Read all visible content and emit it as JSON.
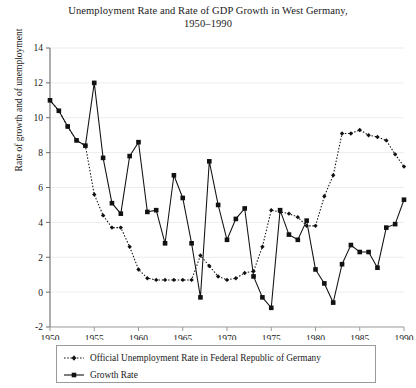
{
  "chart_data": {
    "type": "line",
    "title": "Unemployment Rate and Rate of GDP Growth in West Germany,",
    "subtitle": "1950–1990",
    "xlabel": "",
    "ylabel": "Rate of growth and of unemployment",
    "xlim": [
      1950,
      1990
    ],
    "ylim": [
      -2,
      14
    ],
    "ytick_step": 2,
    "xtick_step": 5,
    "xticks": [
      1950,
      1955,
      1960,
      1965,
      1970,
      1975,
      1980,
      1985,
      1990
    ],
    "yticks": [
      -2,
      0,
      2,
      4,
      6,
      8,
      10,
      12,
      14
    ],
    "grid": "light horizontal gridlines",
    "legend_position": "below plot, bordered box",
    "x": [
      1950,
      1951,
      1952,
      1953,
      1954,
      1955,
      1956,
      1957,
      1958,
      1959,
      1960,
      1961,
      1962,
      1963,
      1964,
      1965,
      1966,
      1967,
      1968,
      1969,
      1970,
      1971,
      1972,
      1973,
      1974,
      1975,
      1976,
      1977,
      1978,
      1979,
      1980,
      1981,
      1982,
      1983,
      1984,
      1985,
      1986,
      1987,
      1988,
      1989,
      1990
    ],
    "series": [
      {
        "name": "Official Unemployment Rate in Federal Republic of Germany",
        "style": "dotted",
        "marker": "small-diamond",
        "color": "#111111",
        "values": [
          11.0,
          10.4,
          9.5,
          8.7,
          8.4,
          5.6,
          4.4,
          3.7,
          3.7,
          2.6,
          1.3,
          0.8,
          0.7,
          0.7,
          0.7,
          0.7,
          0.7,
          2.1,
          1.5,
          0.9,
          0.7,
          0.8,
          1.1,
          1.2,
          2.6,
          4.7,
          4.6,
          4.5,
          4.3,
          3.8,
          3.8,
          5.5,
          6.7,
          9.1,
          9.1,
          9.3,
          9.0,
          8.9,
          8.7,
          7.9,
          7.2
        ]
      },
      {
        "name": "Growth Rate",
        "style": "solid",
        "marker": "square",
        "color": "#111111",
        "values": [
          11.0,
          10.4,
          9.5,
          8.7,
          8.4,
          12.0,
          7.7,
          5.1,
          4.5,
          7.8,
          8.6,
          4.6,
          4.7,
          2.8,
          6.7,
          5.4,
          2.8,
          -0.3,
          7.5,
          5.0,
          3.0,
          4.2,
          4.8,
          0.9,
          -0.3,
          -0.9,
          4.7,
          3.3,
          3.0,
          4.1,
          1.3,
          0.5,
          -0.6,
          1.6,
          2.7,
          2.3,
          2.3,
          1.4,
          3.7,
          3.9,
          5.3
        ]
      }
    ]
  },
  "legend": {
    "items": [
      {
        "label": "Official Unemployment Rate in Federal Republic of Germany",
        "key": "dotted-diamond-key"
      },
      {
        "label": "Growth Rate",
        "key": "solid-square-key"
      }
    ]
  },
  "colors": {
    "ink": "#111111",
    "axis": "#888888",
    "grid": "#ededed",
    "legend_border": "#9a9a9a",
    "background": "#ffffff"
  }
}
